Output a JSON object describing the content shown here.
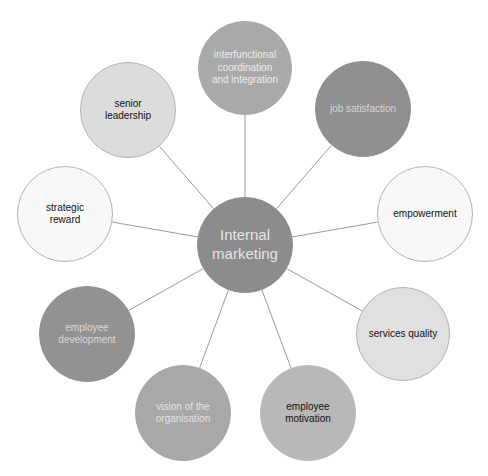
{
  "diagram": {
    "connector_color": "#9a9a9a",
    "center": {
      "label_lines": [
        "Internal",
        "marketing"
      ],
      "x": 245,
      "y": 245,
      "r": 48,
      "fill": "#8c8c8c",
      "stroke": "#8c8c8c",
      "text_color": "#e4e4e4",
      "font_size": 15
    },
    "nodes": [
      {
        "id": "interfunctional",
        "label_lines": [
          "interfunctional",
          "coordination",
          "and integration"
        ],
        "x": 245,
        "y": 68,
        "r": 47,
        "fill": "#a9a9a9",
        "stroke": "#a9a9a9",
        "text_color": "#ececec",
        "font_size": 10
      },
      {
        "id": "job-satisfaction",
        "label_lines": [
          "job satisfaction"
        ],
        "x": 363,
        "y": 109,
        "r": 48,
        "fill": "#8f8f8f",
        "stroke": "#8f8f8f",
        "text_color": "#d8d8d8",
        "font_size": 10
      },
      {
        "id": "empowerment",
        "label_lines": [
          "empowerment"
        ],
        "x": 425,
        "y": 214,
        "r": 48,
        "fill": "#f8f8f8",
        "stroke": "#b4b4b4",
        "text_color": "#111111",
        "font_size": 10
      },
      {
        "id": "services-quality",
        "label_lines": [
          "services quality"
        ],
        "x": 403,
        "y": 334,
        "r": 47,
        "fill": "#e0e0e0",
        "stroke": "#b4b4b4",
        "text_color": "#111111",
        "font_size": 10
      },
      {
        "id": "employee-motivation",
        "label_lines": [
          "employee",
          "motivation"
        ],
        "x": 308,
        "y": 413,
        "r": 48,
        "fill": "#b8b8b8",
        "stroke": "#b8b8b8",
        "text_color": "#111111",
        "font_size": 10
      },
      {
        "id": "vision",
        "label_lines": [
          "vision of the",
          "organisation"
        ],
        "x": 183,
        "y": 413,
        "r": 48,
        "fill": "#a8a8a8",
        "stroke": "#a8a8a8",
        "text_color": "#e4e4e4",
        "font_size": 10
      },
      {
        "id": "employee-development",
        "label_lines": [
          "employee",
          "development"
        ],
        "x": 87,
        "y": 334,
        "r": 48,
        "fill": "#929292",
        "stroke": "#929292",
        "text_color": "#d8d8d8",
        "font_size": 10
      },
      {
        "id": "strategic-reward",
        "label_lines": [
          "strategic",
          "reward"
        ],
        "x": 65,
        "y": 214,
        "r": 48,
        "fill": "#f8f8f8",
        "stroke": "#b4b4b4",
        "text_color": "#111111",
        "font_size": 10
      },
      {
        "id": "senior-leadership",
        "label_lines": [
          "senior",
          "leadership"
        ],
        "x": 128,
        "y": 110,
        "r": 48,
        "fill": "#dcdcdc",
        "stroke": "#b4b4b4",
        "text_color": "#111111",
        "font_size": 10
      }
    ]
  }
}
